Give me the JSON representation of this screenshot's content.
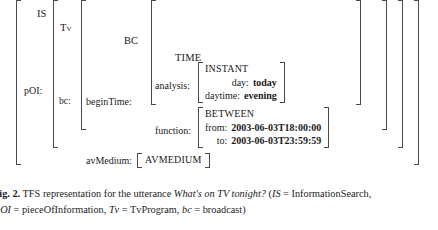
{
  "figure": {
    "kind": "tfs-diagram",
    "colors": {
      "bracket": "#4a4a4a",
      "text": "#1a1a1a",
      "background": "#ffffff"
    },
    "types": {
      "is": "IS",
      "tv": "Tv",
      "bc": "BC",
      "time": "TIME",
      "instant": "INSTANT",
      "between": "BETWEEN",
      "avmedium": "AVMEDIUM"
    },
    "attributes": {
      "poi": "pOI:",
      "bc": "bc:",
      "begin_time": "beginTime:",
      "analysis": "analysis:",
      "function": "function:",
      "av_medium": "avMedium:",
      "day": "day:",
      "daytime": "daytime:",
      "from": "from:",
      "to": "to:"
    },
    "values": {
      "day": "today",
      "daytime": "evening",
      "from": "2003-06-03T18:00:00",
      "to": "2003-06-03T23:59:59"
    }
  },
  "caption": {
    "label": "Fig. 2.",
    "line1_pre": " TFS representation for the utterance ",
    "utterance": "What's on TV tonight?",
    "line1_post": " (",
    "abbr1_sym": "IS",
    "abbr1_txt": " = InformationSearch,",
    "abbr2_sym": "pOI",
    "abbr2_txt": " = pieceOfInformation, ",
    "abbr3_sym": "Tv",
    "abbr3_txt": " = TvProgram, ",
    "abbr4_sym": "bc",
    "abbr4_txt": " = broadcast)"
  }
}
